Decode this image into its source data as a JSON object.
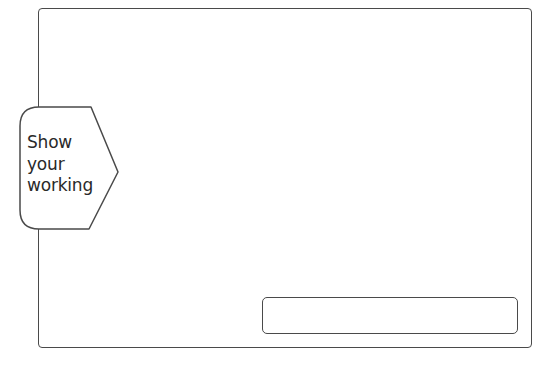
{
  "tab": {
    "lines": [
      "Show",
      "your",
      "working"
    ]
  },
  "answer_box": {
    "value": ""
  },
  "colors": {
    "stroke": "#4a4a4a",
    "text": "#2a2a2a",
    "background": "#ffffff"
  }
}
